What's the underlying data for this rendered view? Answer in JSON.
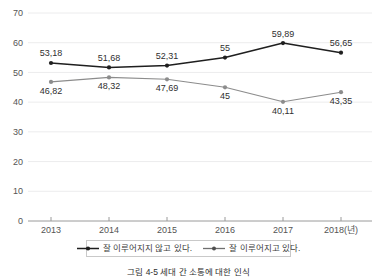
{
  "chart_data": {
    "type": "line",
    "title": "",
    "xlabel": "",
    "ylabel": "",
    "categories": [
      "2013",
      "2014",
      "2015",
      "2016",
      "2017",
      "2018"
    ],
    "tick_labels": [
      "2013",
      "2014",
      "2015",
      "2016",
      "2017",
      "2018(년)"
    ],
    "ylim": [
      0,
      70
    ],
    "y_ticks": [
      "0",
      "10",
      "20",
      "30",
      "40",
      "50",
      "60",
      "70"
    ],
    "y_tick_values": [
      0,
      10,
      20,
      30,
      40,
      50,
      60,
      70
    ],
    "grid": true,
    "legend_position": "bottom",
    "decimal_separator": ",",
    "series": [
      {
        "name": "잘 이루어지지 않고 있다.",
        "color": "#1f1f1f",
        "line_width": 1.6,
        "label_position": "above",
        "values": [
          53.18,
          51.68,
          52.31,
          55,
          59.89,
          56.65
        ],
        "point_labels": [
          "53,18",
          "51,68",
          "52,31",
          "55",
          "59,89",
          "56,65"
        ]
      },
      {
        "name": "잘 이루어지고 있다.",
        "color": "#8c8c8c",
        "line_width": 1.1,
        "label_position": "below",
        "values": [
          46.82,
          48.32,
          47.69,
          45,
          40.11,
          43.35
        ],
        "point_labels": [
          "46,82",
          "48,32",
          "47,69",
          "45",
          "40,11",
          "43,35"
        ]
      }
    ]
  },
  "legend": {
    "entries": [
      {
        "label": "잘 이루어지지 않고 있다."
      },
      {
        "label": "잘 이루어지고 있다."
      }
    ]
  },
  "caption": {
    "text": "그림 4-5 세대 간 소통에 대한 인식"
  },
  "colors": {
    "series_primary": "#1f1f1f",
    "series_secondary": "#8c8c8c",
    "gridline": "#ececed",
    "axis": "#9a9a9a",
    "tick_text": "#545454",
    "label_text": "#3d3d3d"
  }
}
